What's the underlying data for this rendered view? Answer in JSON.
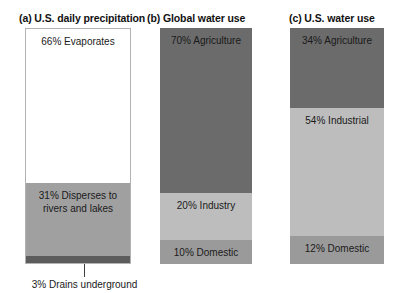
{
  "chart_data": {
    "type": "bar",
    "title": "",
    "layout": "three stacked 100% bar charts side by side",
    "grid": false,
    "legend": "none",
    "ylim": [
      0,
      100
    ],
    "ylabel": "",
    "xlabel": "",
    "panels": [
      {
        "id": "a",
        "title": "(a) U.S. daily precipitation",
        "segments": [
          {
            "label": "66% Evaporates",
            "value": 66,
            "name": "Evaporates",
            "color": "#ffffff",
            "label_position": "top"
          },
          {
            "label": "31% Disperses to\nrivers and lakes",
            "value": 31,
            "name": "Disperses to rivers and lakes",
            "color": "#a0a0a0",
            "label_position": "top"
          },
          {
            "label": "",
            "value": 3,
            "name": "Drains underground",
            "color": "#5c5c5c",
            "label_position": "external"
          }
        ],
        "annotation": {
          "text": "3% Drains underground",
          "value": 3,
          "leader": true
        }
      },
      {
        "id": "b",
        "title": "(b) Global water use",
        "segments": [
          {
            "label": "70% Agriculture",
            "value": 70,
            "name": "Agriculture",
            "color": "#6b6b6b",
            "label_position": "top"
          },
          {
            "label": "20% Industry",
            "value": 20,
            "name": "Industry",
            "color": "#bdbdbd",
            "label_position": "top"
          },
          {
            "label": "10% Domestic",
            "value": 10,
            "name": "Domestic",
            "color": "#9a9a9a",
            "label_position": "top"
          }
        ]
      },
      {
        "id": "c",
        "title": "(c) U.S. water use",
        "segments": [
          {
            "label": "34% Agriculture",
            "value": 34,
            "name": "Agriculture",
            "color": "#6b6b6b",
            "label_position": "top"
          },
          {
            "label": "54% Industrial",
            "value": 54,
            "name": "Industrial",
            "color": "#bdbdbd",
            "label_position": "top"
          },
          {
            "label": "12% Domestic",
            "value": 12,
            "name": "Domestic",
            "color": "#9a9a9a",
            "label_position": "top"
          }
        ]
      }
    ],
    "colors": {
      "white": "#ffffff",
      "light_gray": "#bdbdbd",
      "medium_gray": "#9a9a9a",
      "disperse_gray": "#a0a0a0",
      "dark_gray": "#6b6b6b",
      "darkest_gray": "#5c5c5c",
      "border": "#b3b3b3",
      "text": "#1a1a1a"
    }
  }
}
